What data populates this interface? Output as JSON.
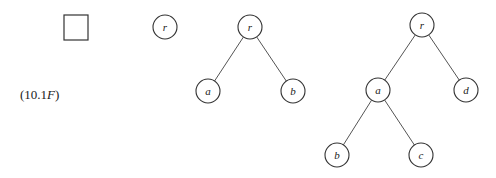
{
  "equation_label": {
    "prefix": "(10.1",
    "italic": "F",
    "suffix": ")"
  },
  "trees": [
    {
      "name": "empty-tree",
      "nodes": [],
      "edges": []
    },
    {
      "name": "single-node-tree",
      "nodes": [
        {
          "id": "r",
          "label": "r",
          "x": 165,
          "y": 27
        }
      ],
      "edges": []
    },
    {
      "name": "three-node-tree",
      "nodes": [
        {
          "id": "r",
          "label": "r",
          "x": 250,
          "y": 27
        },
        {
          "id": "a",
          "label": "a",
          "x": 208,
          "y": 91
        },
        {
          "id": "b",
          "label": "b",
          "x": 293,
          "y": 91
        }
      ],
      "edges": [
        [
          "r",
          "a"
        ],
        [
          "r",
          "b"
        ]
      ]
    },
    {
      "name": "five-node-tree",
      "nodes": [
        {
          "id": "r",
          "label": "r",
          "x": 422,
          "y": 25
        },
        {
          "id": "a",
          "label": "a",
          "x": 378,
          "y": 90
        },
        {
          "id": "d",
          "label": "d",
          "x": 466,
          "y": 90
        },
        {
          "id": "b",
          "label": "b",
          "x": 337,
          "y": 155
        },
        {
          "id": "c",
          "label": "c",
          "x": 421,
          "y": 155
        }
      ],
      "edges": [
        [
          "r",
          "a"
        ],
        [
          "r",
          "d"
        ],
        [
          "a",
          "b"
        ],
        [
          "a",
          "c"
        ]
      ]
    }
  ]
}
